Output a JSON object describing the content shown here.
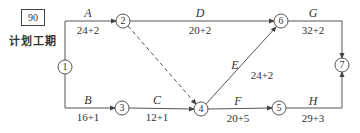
{
  "plan_duration": {
    "value": "90",
    "caption": "计划工期"
  },
  "nodes": [
    {
      "id": "1",
      "x": 65,
      "y": 67
    },
    {
      "id": "2",
      "x": 123,
      "y": 21
    },
    {
      "id": "3",
      "x": 122,
      "y": 108
    },
    {
      "id": "4",
      "x": 201,
      "y": 109
    },
    {
      "id": "5",
      "x": 279,
      "y": 108
    },
    {
      "id": "6",
      "x": 281,
      "y": 21
    },
    {
      "id": "7",
      "x": 342,
      "y": 65
    }
  ],
  "activities": [
    {
      "name": "A",
      "from": "1",
      "to": "2",
      "duration": "24+2"
    },
    {
      "name": "B",
      "from": "1",
      "to": "3",
      "duration": "16+1"
    },
    {
      "name": "C",
      "from": "3",
      "to": "4",
      "duration": "12+1"
    },
    {
      "name": "D",
      "from": "2",
      "to": "6",
      "duration": "20+2"
    },
    {
      "name": "E",
      "from": "4",
      "to": "6",
      "duration": "24+2"
    },
    {
      "name": "F",
      "from": "4",
      "to": "5",
      "duration": "20+5"
    },
    {
      "name": "G",
      "from": "6",
      "to": "7",
      "duration": "32+2"
    },
    {
      "name": "H",
      "from": "5",
      "to": "7",
      "duration": "29+3"
    },
    {
      "name": "",
      "from": "2",
      "to": "4",
      "duration": "",
      "dummy": true
    }
  ]
}
